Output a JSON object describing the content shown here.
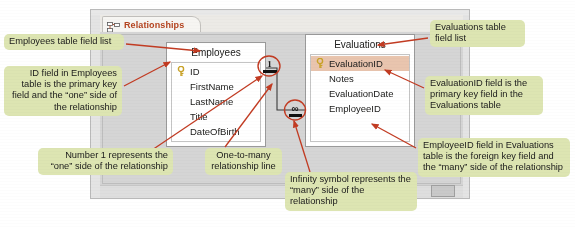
{
  "window": {
    "tab": {
      "label": "Relationships",
      "icon": "relationships-icon"
    }
  },
  "tables": [
    {
      "id": "employees",
      "title": "Employees",
      "fields": [
        {
          "name": "ID",
          "primary_key": true,
          "selected": false
        },
        {
          "name": "FirstName",
          "primary_key": false,
          "selected": false
        },
        {
          "name": "LastName",
          "primary_key": false,
          "selected": false
        },
        {
          "name": "Title",
          "primary_key": false,
          "selected": false
        },
        {
          "name": "DateOfBirth",
          "primary_key": false,
          "selected": false
        }
      ]
    },
    {
      "id": "evaluations",
      "title": "Evaluations",
      "fields": [
        {
          "name": "EvaluationID",
          "primary_key": true,
          "selected": true
        },
        {
          "name": "Notes",
          "primary_key": false,
          "selected": false
        },
        {
          "name": "EvaluationDate",
          "primary_key": false,
          "selected": false
        },
        {
          "name": "EmployeeID",
          "primary_key": false,
          "selected": false
        }
      ]
    }
  ],
  "relationship": {
    "one_symbol": "1",
    "many_symbol": "∞"
  },
  "callouts": {
    "employees_field_list": "Employees table field list",
    "id_field": "ID field in Employees table is the primary key field and the “one” side of the relationship",
    "number_one": "Number 1 represents the “one” side of the relationship",
    "one_to_many_line": "One-to-many relationship line",
    "infinity_symbol": "Infinity symbol represents the “many” side of the relationship",
    "evaluations_field_list": "Evaluations table field list",
    "evaluation_id_field": "EvaluationID field is the primary key field in the Evaluations table",
    "employee_id_field": "EmployeeID field in Evaluations table is the foreign key field and the “many” side of the relationship"
  },
  "colors": {
    "callout_bg": "#dde5b2",
    "arrow": "#c23b22",
    "tab_text": "#b4431f",
    "selected_row": "#e9c5ae",
    "window_bg": "#d7d7d7"
  }
}
